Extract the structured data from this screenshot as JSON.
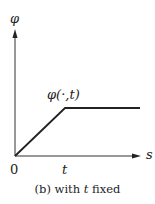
{
  "diagram": {
    "y_axis_label": "φ",
    "x_axis_label": "s",
    "curve_label": "φ(·,t)",
    "origin_label": "0",
    "x_tick_label": "t",
    "caption_prefix": "(b) with ",
    "caption_var": "t",
    "caption_suffix": " fixed",
    "curve_points": [
      [
        0,
        0
      ],
      [
        1,
        1
      ],
      [
        2.5,
        1
      ]
    ],
    "line_color": "#222222"
  }
}
